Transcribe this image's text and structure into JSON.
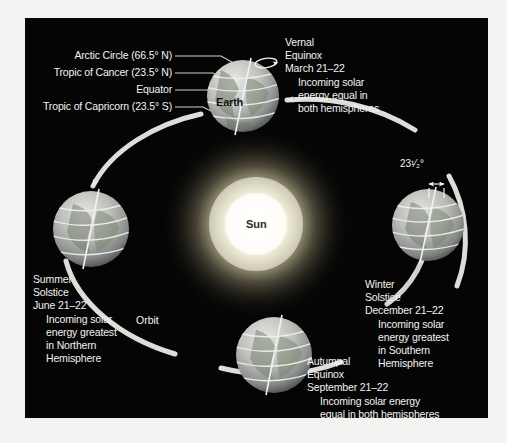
{
  "figure": {
    "background_color": "#050505",
    "page_color": "#f4f3f1",
    "sun": {
      "label": "Sun",
      "glow_color": "#fffbe8"
    },
    "orbit": {
      "label": "Orbit",
      "direction": "counterclockwise"
    },
    "earth_top": {
      "name": "Earth",
      "tilt_note": "rotation-arrow",
      "latitude_lines": [
        {
          "label": "Arctic Circle (66.5° N)",
          "value": 66.5,
          "hemisphere": "N"
        },
        {
          "label": "Tropic of Cancer (23.5° N)",
          "value": 23.5,
          "hemisphere": "N"
        },
        {
          "label": "Equator",
          "value": 0,
          "hemisphere": ""
        },
        {
          "label": "Tropic of Capricorn (23.5° S)",
          "value": 23.5,
          "hemisphere": "S"
        }
      ]
    },
    "axis_tilt": {
      "label": "23¹⁄₂°",
      "degrees": 23.5
    },
    "events": [
      {
        "id": "vernal-equinox",
        "season": "Vernal",
        "kind": "Equinox",
        "date": "March 21–22",
        "detail": [
          "Incoming solar",
          "energy equal in",
          "both hemispheres"
        ]
      },
      {
        "id": "summer-solstice",
        "season": "Summer",
        "kind": "Solstice",
        "date": "June 21–22",
        "detail": [
          "Incoming solar",
          "energy greatest",
          "in Northern",
          "Hemisphere"
        ]
      },
      {
        "id": "autumnal-equinox",
        "season": "Autumnal",
        "kind": "Equinox",
        "date": "September 21–22",
        "detail": [
          "Incoming solar energy",
          "equal in both hemispheres"
        ]
      },
      {
        "id": "winter-solstice",
        "season": "Winter",
        "kind": "Solstice",
        "date": "December 21–22",
        "detail": [
          "Incoming solar",
          "energy greatest",
          "in Southern",
          "Hemisphere"
        ]
      }
    ]
  }
}
